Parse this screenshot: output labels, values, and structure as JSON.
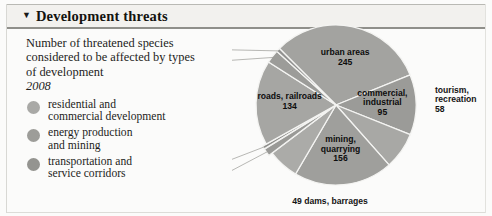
{
  "header": {
    "title": "Development threats",
    "toggle_icon": "triangle-down-icon"
  },
  "description": {
    "line1": "Number of threatened species",
    "line2": "considered to be affected by",
    "line3": "types of development",
    "year": "2008"
  },
  "legend": {
    "items": [
      {
        "label_line1": "residential and",
        "label_line2": "commercial development",
        "color": "#a9a9a6"
      },
      {
        "label_line1": "energy production",
        "label_line2": "and mining",
        "color": "#9d9d99"
      },
      {
        "label_line1": "transportation and",
        "label_line2": "service corridors",
        "color": "#949490"
      }
    ]
  },
  "chart_data": {
    "type": "pie",
    "title": "Development threats",
    "subtitle": "Number of threatened species considered to be affected by types of development, 2008",
    "total": 736,
    "units": "threatened species",
    "legend_position": "left",
    "grid": false,
    "categories": [
      "urban areas",
      "commercial, industrial",
      "tourism, recreation",
      "mining, quarrying",
      "dams, barrages",
      "renewable energy",
      "drilling",
      "roads, railroads",
      "service lines",
      "shipping lanes"
    ],
    "values": [
      245,
      95,
      58,
      156,
      49,
      12,
      5,
      134,
      21,
      6
    ],
    "slices": [
      {
        "label": "urban areas",
        "value": 245,
        "label_line1": "urban areas",
        "label_line2": "245",
        "value_text": "245",
        "placement": "inside",
        "color": "#a3a3a0"
      },
      {
        "label": "commercial, industrial",
        "value": 95,
        "label_line1": "commercial,",
        "label_line2": "industrial",
        "label_line3": "95",
        "value_text": "95",
        "placement": "inside",
        "color": "#9b9b98"
      },
      {
        "label": "tourism, recreation",
        "value": 58,
        "label_line1": "tourism,",
        "label_line2": "recreation",
        "label_line3": "58",
        "value_text": "58",
        "placement": "outside",
        "color": "#a8a8a5"
      },
      {
        "label": "mining, quarrying",
        "value": 156,
        "label_line1": "mining,",
        "label_line2": "quarrying",
        "label_line3": "156",
        "value_text": "156",
        "placement": "inside",
        "color": "#9f9f9c"
      },
      {
        "label": "49 dams, barrages",
        "value": 49,
        "label_line1": "49 dams, barrages",
        "value_text": "49",
        "placement": "outside",
        "color": "#ababa8"
      },
      {
        "label": "renewable energy 12",
        "value": 12,
        "label_line1": "renewable energy 12",
        "value_text": "12",
        "placement": "outside",
        "color": "#9a9a97"
      },
      {
        "label": "drilling 5",
        "value": 5,
        "label_line1": "drilling 5",
        "value_text": "5",
        "placement": "outside",
        "color": "#8f8f8c"
      },
      {
        "label": "roads, railroads",
        "value": 134,
        "label_line1": "roads, railroads",
        "label_line2": "134",
        "value_text": "134",
        "placement": "inside",
        "color": "#a6a6a3"
      },
      {
        "label": "service lines 21",
        "value": 21,
        "label_line1": "service lines 21",
        "value_text": "21",
        "placement": "outside",
        "color": "#9c9c99"
      },
      {
        "label": "shipping lanes 6",
        "value": 6,
        "label_line1": "shipping lanes 6",
        "value_text": "6",
        "placement": "outside",
        "color": "#919190"
      }
    ]
  }
}
